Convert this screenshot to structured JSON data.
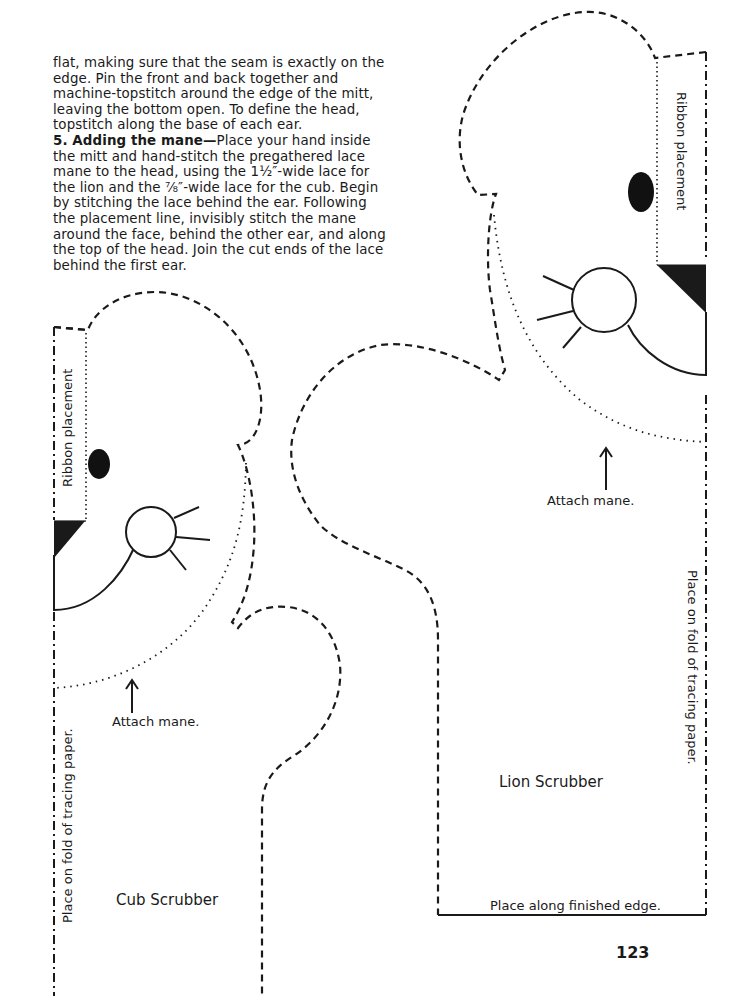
{
  "instructions": {
    "para1": "flat, making sure that the seam is exactly on the edge. Pin the front and back together and machine-topstitch around the edge of the mitt, leaving the bottom open. To define the head, topstitch along the base of each ear.",
    "step5_heading": "5. Adding the mane—",
    "step5_text": "Place your hand inside the mitt and hand-stitch the pregathered lace mane to the head, using the 1½″-wide lace for the lion and the ⅞″-wide lace for the cub. Begin by stitching the lace behind the ear. Following the placement line, invisibly stitch the mane around the face, behind the other ear, and along the top of the head. Join the cut ends of the lace behind the first ear."
  },
  "lion_pattern": {
    "title": "Lion Scrubber",
    "ribbon_label": "Ribbon placement",
    "mane_label": "Attach mane.",
    "fold_label": "Place on fold of tracing paper.",
    "edge_label": "Place along finished edge."
  },
  "cub_pattern": {
    "title": "Cub Scrubber",
    "ribbon_label": "Ribbon placement",
    "mane_label": "Attach mane.",
    "fold_label": "Place on fold of tracing paper."
  },
  "page_number": "123",
  "colors": {
    "ink": "#1a1a1a",
    "paper": "#ffffff"
  }
}
